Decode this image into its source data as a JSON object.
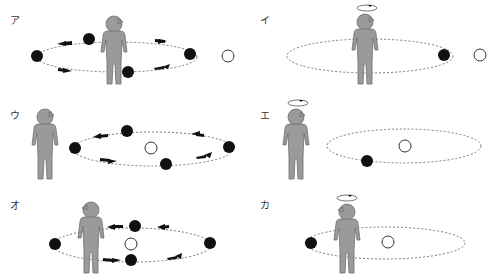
{
  "colors": {
    "person": "#9a9a9a",
    "person_outline": "#6e6e6e",
    "orbit": "#777777",
    "satellite": "#111111",
    "moon_open": "#ffffff",
    "arrow": "#111111"
  },
  "panels": [
    {
      "id": "a",
      "label": "ア",
      "description": "Person at center of orbit; four black balls circling with arrows; open circle outside orbit to the right"
    },
    {
      "id": "i",
      "label": "イ",
      "description": "Person spinning (rotation arrow above head) at center of orbit; one black ball on right edge of orbit; open circle outside right"
    },
    {
      "id": "u",
      "label": "ウ",
      "description": "Person standing left of orbit; four black balls circling with arrows around open circle at center"
    },
    {
      "id": "e",
      "label": "エ",
      "description": "Person spinning (rotation arrow above head) left of orbit; one black ball on lower-left of orbit; open circle at center"
    },
    {
      "id": "o",
      "label": "オ",
      "description": "Person inside left part of orbit; four black balls circling with arrows around open circle near person"
    },
    {
      "id": "ka",
      "label": "カ",
      "description": "Person spinning (rotation arrow above head) inside left part of orbit; one black ball at left edge; open circle at center"
    }
  ]
}
